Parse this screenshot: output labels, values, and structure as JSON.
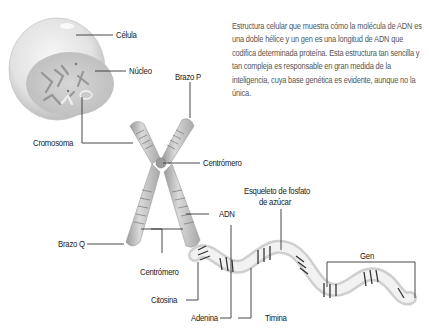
{
  "description": "Estructura celular que muestra cómo la molécula de ADN es una doble hélice y un gen es una longitud de ADN que codifica determinada proteína. Esta estructura tan sencilla y tan compleja es responsable en gran medida de la inteligencia, cuya base genética es evidente, aunque no la única.",
  "labels": {
    "celula": "Célula",
    "nucleo": "Núcleo",
    "cromosoma": "Cromosoma",
    "brazo_p": "Brazo P",
    "centromero_top": "Centrómero",
    "esqueleto_line1": "Esqueleto de fosfato",
    "esqueleto_line2": "de azúcar",
    "adn": "ADN",
    "brazo_q": "Brazo Q",
    "centromero_bottom": "Centrómero",
    "gen": "Gen",
    "citosina": "Citosina",
    "adenina": "Adenina",
    "timina": "Timina"
  },
  "colors": {
    "line": "#333333",
    "text": "#222222",
    "cell_fill": "#e6e6e6",
    "nucleus_fill": "#c9c9c9",
    "chromosome_fill": "#bdbdbd"
  }
}
